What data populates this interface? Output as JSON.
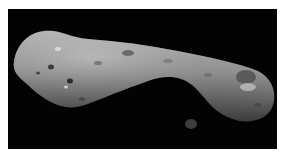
{
  "image": {
    "subject": "Elongated rocky asteroid with cratered grey surface on black space background",
    "alt": "Asteroid photograph",
    "colors": {
      "background": "#030303",
      "frame": "#ffffff",
      "surface_light": "#bdbdbd",
      "surface_mid": "#8a8a8a",
      "surface_dark": "#4a4a4a"
    }
  }
}
